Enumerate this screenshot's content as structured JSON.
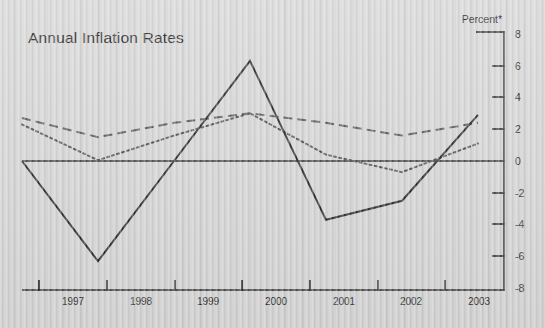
{
  "chart_data": {
    "type": "line",
    "title": "Annual Inflation Rates",
    "xlabel": "",
    "ylabel": "Percent*",
    "ylim": [
      -8,
      8
    ],
    "xlim": [
      1996.5,
      2003.5
    ],
    "grid": false,
    "legend": "none",
    "y_ticks": [
      8,
      6,
      4,
      2,
      0,
      -2,
      -4,
      -6,
      -8
    ],
    "y_tick_labels": [
      "8",
      "6",
      "4",
      "2",
      "0",
      "-2",
      "-4",
      "-6",
      "-8"
    ],
    "x_ticks": [
      1997,
      1998,
      1999,
      2000,
      2001,
      2002,
      2003
    ],
    "categories": [
      "1997",
      "1998",
      "1999",
      "2000",
      "2001",
      "2002",
      "2003"
    ],
    "zero_line": true,
    "series": [
      {
        "name": "series-solid",
        "style": "solid",
        "color": "#262626",
        "values": [
          0.0,
          -6.3,
          0.0,
          6.3,
          -3.7,
          -2.5,
          2.9
        ]
      },
      {
        "name": "series-dashed",
        "style": "dashed",
        "color": "#575757",
        "values": [
          2.7,
          1.5,
          2.4,
          3.0,
          2.4,
          1.6,
          2.4
        ]
      },
      {
        "name": "series-dotted",
        "style": "dotted",
        "color": "#4f4f4f",
        "values": [
          2.3,
          0.05,
          1.6,
          3.0,
          0.4,
          -0.7,
          1.1
        ]
      }
    ]
  },
  "chart": {
    "title": "Annual Inflation Rates",
    "unit_label": "Percent*",
    "y_axis": {
      "labels": [
        "8",
        "6",
        "4",
        "2",
        "0",
        "-2",
        "-4",
        "-6",
        "-8"
      ]
    },
    "x_axis": {
      "labels": [
        "1997",
        "1998",
        "1999",
        "2000",
        "2001",
        "2002",
        "2003"
      ]
    }
  },
  "colors": {
    "background": "#d6d6d6",
    "ink": "#1c1c1c",
    "solid_line": "#262626",
    "dashed_line": "#575757",
    "dotted_line": "#4f4f4f",
    "axis": "#1f1f1f"
  }
}
